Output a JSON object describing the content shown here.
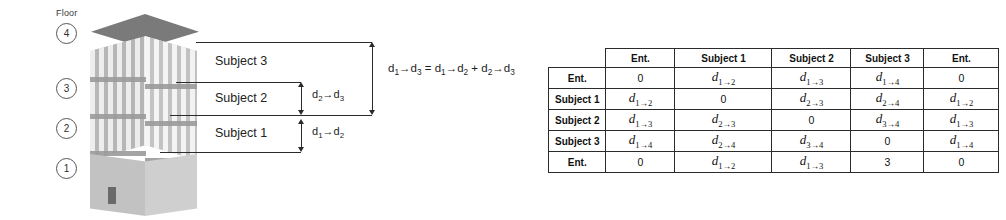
{
  "diagram": {
    "floor_header": "Floor",
    "floors": [
      "4",
      "3",
      "2",
      "1"
    ],
    "zones": [
      "Subject 3",
      "Subject 2",
      "Subject 1"
    ],
    "dimensions": {
      "inner_upper": "d2→d3",
      "inner_lower": "d1→d2",
      "outer": "d1→d3"
    },
    "equation": "d1→d3 = d1→d2 + d2→d3",
    "equation_parts": {
      "lhs_from": "d",
      "lhs_from_sub": "1",
      "lhs_to": "d",
      "lhs_to_sub": "3",
      "rhs1_sub": "2",
      "rhs2_sub": "3"
    },
    "colors": {
      "roof": "#6f6f6f",
      "wall_light": "#d8d8d8",
      "wall_dark": "#bdbdbd",
      "slab": "#9a9a9a",
      "line": "#2b2b2b",
      "door": "#6a6a6a"
    }
  },
  "matrix": {
    "columns": [
      "",
      "Ent.",
      "Subject 1",
      "Subject 2",
      "Subject 3",
      "Ent."
    ],
    "rows": [
      {
        "label": "Ent.",
        "cells": [
          "0",
          "d1→2",
          "d1→3",
          "d1→4",
          "0"
        ]
      },
      {
        "label": "Subject 1",
        "cells": [
          "d1→2",
          "0",
          "d2→3",
          "d2→4",
          "d1→2"
        ]
      },
      {
        "label": "Subject 2",
        "cells": [
          "d1→3",
          "d2→3",
          "0",
          "d3→4",
          "d1→3"
        ]
      },
      {
        "label": "Subject 3",
        "cells": [
          "d1→4",
          "d2→4",
          "d3→4",
          "0",
          "d1→4"
        ]
      },
      {
        "label": "Ent.",
        "cells": [
          "0",
          "d1→2",
          "d1→3",
          "3",
          "0"
        ]
      }
    ]
  }
}
